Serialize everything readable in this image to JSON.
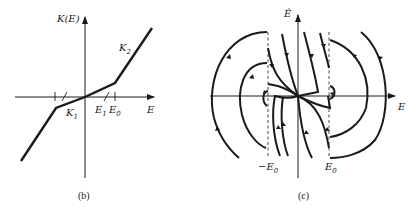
{
  "panel_b": {
    "caption": "(b)",
    "y_axis_label": "K(E)",
    "x_axis_label": "E",
    "segment_labels": {
      "k1": "K",
      "k1_sub": "1",
      "k2": "K",
      "k2_sub": "2"
    },
    "tick_labels": {
      "e1": "E",
      "e1_sub": "1",
      "e0": "E",
      "e0_sub": "0"
    },
    "description": "Piecewise-linear function K(E): shallow slope K1 between -E0 and E0 through origin, steeper slope K2 beyond"
  },
  "panel_c": {
    "caption": "(c)",
    "y_axis_label": "Ê",
    "x_axis_label": "E",
    "tick_labels": {
      "neg_e0": "−E",
      "neg_e0_sub": "0",
      "e0": "E",
      "e0_sub": "0"
    },
    "description": "Phase portrait with trajectories in E–Ê plane, dashed switching lines at ±E0"
  },
  "colors": {
    "ink": "#1a1a1a",
    "background": "#ffffff"
  }
}
